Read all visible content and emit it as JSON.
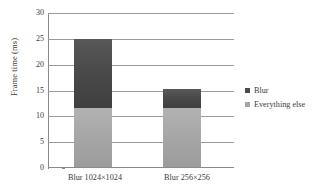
{
  "chart_data": {
    "type": "bar",
    "subtype": "stacked-bar",
    "title": "",
    "xlabel": "",
    "ylabel": "Frame time (ms)",
    "categories": [
      "Blur 1024×1024",
      "Blur 256×256"
    ],
    "series": [
      {
        "name": "Everything else",
        "values": [
          11.5,
          11.5
        ],
        "color": "#a6a6a6"
      },
      {
        "name": "Blur",
        "values": [
          13.5,
          3.7
        ],
        "color": "#4a4a4a"
      }
    ],
    "stack_totals": [
      25.0,
      15.2
    ],
    "ylim": [
      0,
      30
    ],
    "yticks": [
      0,
      5,
      10,
      15,
      20,
      25,
      30
    ],
    "ytick_labels": [
      "0",
      "5",
      "10",
      "15",
      "20",
      "25",
      "30"
    ],
    "grid": "horizontal",
    "legend_position": "right"
  },
  "axes": {
    "y_title": "Frame time (ms)",
    "y_ticks": [
      "30",
      "25",
      "20",
      "15",
      "10",
      "5",
      "0"
    ],
    "x_categories": [
      "Blur 1024×1024",
      "Blur 256×256"
    ]
  },
  "legend": {
    "items": [
      {
        "label": "Blur",
        "swatch": "legend-swatch-blur",
        "color": "#4a4a4a"
      },
      {
        "label": "Everything else",
        "swatch": "legend-swatch-everything-else",
        "color": "#a6a6a6"
      }
    ]
  },
  "colors": {
    "blur": "#4a4a4a",
    "everything_else": "#a6a6a6",
    "grid": "#9a9a9a",
    "axis": "#8a8a8a",
    "text": "#3a3a3a",
    "background": "#ffffff"
  }
}
